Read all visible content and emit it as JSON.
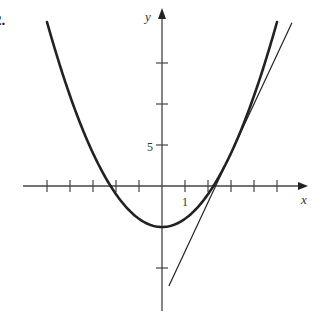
{
  "problem": {
    "label": "2."
  },
  "chart_data": {
    "type": "line",
    "title": "",
    "xlabel": "x",
    "ylabel": "y",
    "tick_labels": {
      "x": [
        "1"
      ],
      "y": [
        "5"
      ]
    },
    "x_ticks": [
      -5,
      -4,
      -3,
      -2,
      -1,
      1,
      2,
      3,
      4,
      5
    ],
    "y_ticks": [
      -10,
      -5,
      5,
      10,
      15
    ],
    "xlim": [
      -6,
      6.3
    ],
    "ylim": [
      -15.2,
      20
    ],
    "grid": false,
    "legend": null,
    "series": [
      {
        "name": "parabola y = x^2 - 5",
        "kind": "curve",
        "function": "x^2 - 5",
        "x_range": [
          -5,
          5
        ],
        "points": [
          [
            -5,
            20
          ],
          [
            -4,
            11
          ],
          [
            -3,
            4
          ],
          [
            -2,
            -1
          ],
          [
            -1,
            -4
          ],
          [
            0,
            -5
          ],
          [
            1,
            -4
          ],
          [
            2,
            -1
          ],
          [
            3,
            4
          ],
          [
            4,
            11
          ],
          [
            5,
            20
          ]
        ],
        "stroke_width": 2.6
      },
      {
        "name": "tangent line at (3, 4): y = 6x - 14",
        "kind": "line",
        "function": "6x - 14",
        "x_range": [
          0.3,
          5.65
        ],
        "points": [
          [
            0.3,
            -12.2
          ],
          [
            5.65,
            19.9
          ]
        ],
        "stroke_width": 1.2
      }
    ],
    "tangent_point": [
      3,
      4
    ]
  },
  "layout": {
    "origin_px": [
      162,
      186
    ],
    "px_per_x": 23,
    "px_per_y": 8.2,
    "x_axis_px": [
      23,
      308
    ],
    "y_axis_px": [
      311,
      8
    ],
    "colors": {
      "ink": "#222222",
      "axis": "#444444",
      "background": "#ffffff"
    }
  }
}
